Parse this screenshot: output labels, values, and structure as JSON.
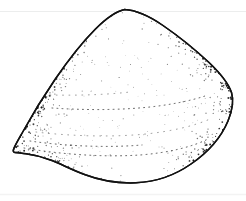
{
  "figure": {
    "title": "Bivalve shell exterior, left valve",
    "caption": "",
    "medium": "stippled ink line drawing",
    "background_color": "#ffffff",
    "ink_color": "#121212",
    "scan_line_color": "#ececed",
    "canvas": {
      "width": 246,
      "height": 201
    }
  },
  "specimen": {
    "label": "shell-outline",
    "orientation": "umbo up, anterior left, posterior right",
    "outline_path": "M 124.5 9.5 C 137 10.2 150 16.5 163 25.5 C 178 35.8 194 48.5 209 62.5 C 220 73 228.5 83.5 231.5 92.5 C 234 100.5 232.5 110 228 121 C 221.5 136.5 208.5 152 191 164 C 174.5 175.5 155 182 136 182.8 C 117 183.6 99 180 84.5 174.5 C 72 169.8 62 164.5 52 160.5 C 43 157 34 154.8 26 153.8 C 20 153 16 152.6 14.2 152.2 C 13.2 151.9 13.0 150.8 13.6 149.2 C 15.0 145.4 18.5 139.5 23 131.5 C 31 117 42 98.5 55 79.5 C 68.5 59.8 82 42.5 95.5 29 C 106 18.5 115.5 11.5 124.5 9.5 Z",
    "umbo": {
      "x": 124,
      "y": 9,
      "name": "beak-apex"
    },
    "shaded_margins": [
      {
        "name": "anterior-dorsal-shade-band",
        "side": "left",
        "density": "dense"
      },
      {
        "name": "anterior-ventral-shade-band",
        "side": "lower-left",
        "density": "dense"
      },
      {
        "name": "posterior-shade-band",
        "side": "right",
        "density": "dense"
      }
    ],
    "growth_lines": [
      {
        "name": "growth-line-1",
        "path": "M 52 108 C 82 110 116 110.5 150 107 C 170 104.8 190 101 205 96"
      },
      {
        "name": "growth-line-2",
        "path": "M 36 132 C 70 136 110 137.5 146 134 C 172 131.2 194 126 210 119"
      },
      {
        "name": "growth-line-3",
        "path": "M 24 148 C 58 154 102 157.5 140 155 C 168 152.8 192 147 208 139"
      },
      {
        "name": "growth-line-4",
        "path": "M 50 95 C 76 95.5 104 95 130 92"
      },
      {
        "name": "growth-line-5",
        "path": "M 30 141 C 64 146 106 148 142 145"
      }
    ],
    "scan_lines": [
      {
        "name": "scan-line-top",
        "y": 11.5
      },
      {
        "name": "scan-line-bottom",
        "y": 194.5
      }
    ]
  },
  "stipple": {
    "description": "ink dot shading along shell margins fading toward the centre",
    "dot_color": "#111111",
    "seed": 20240517,
    "bands": [
      {
        "name": "left-dorsal",
        "count": 1500
      },
      {
        "name": "left-ventral",
        "count": 900
      },
      {
        "name": "right-posterior",
        "count": 1200
      },
      {
        "name": "interior-fade",
        "count": 700
      }
    ]
  }
}
